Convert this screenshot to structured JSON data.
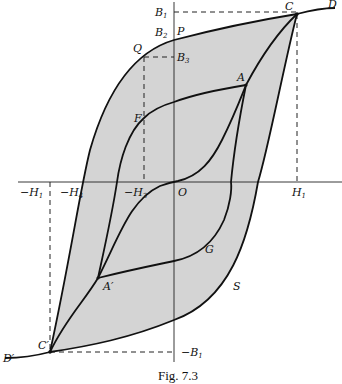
{
  "figure": {
    "caption": "Fig. 7.3",
    "colors": {
      "shading": "#d4d4d4",
      "lines": "#111111",
      "background": "#ffffff"
    }
  },
  "labels": {
    "B1": "B",
    "B1_sub": "1",
    "B2": "B",
    "B2_sub": "2",
    "B3": "B",
    "B3_sub": "3",
    "P": "P",
    "Q": "Q",
    "C": "C",
    "D": "D",
    "A": "A",
    "F": "F",
    "O": "O",
    "G": "G",
    "S": "S",
    "A_prime": "A′",
    "C_prime": "C′",
    "D_prime": "D′",
    "neg_H1": "−H",
    "neg_H1_sub": "1",
    "neg_H4": "−H",
    "neg_H4_sub": "4",
    "neg_H3": "−H",
    "neg_H3_sub": "3",
    "H1": "H",
    "H1_sub": "1",
    "neg_B1": "−B",
    "neg_B1_sub": "1"
  }
}
